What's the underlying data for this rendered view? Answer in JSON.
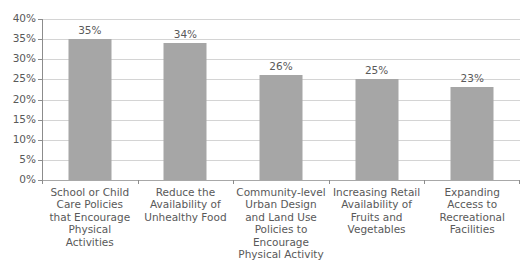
{
  "chart_data": {
    "type": "bar",
    "title": "",
    "subtitle": "",
    "xlabel": "",
    "ylabel": "",
    "ylim": [
      0,
      40
    ],
    "ytick_step": 5,
    "grid": true,
    "legend": "none",
    "value_label_format": "percent",
    "bar_color": "#a6a6a6",
    "gridline_color": "#d4d4d4",
    "axis_color": "#8c8c8c",
    "text_color": "#595959",
    "categories": [
      "School or Child Care Policies that Encourage Physical Activities",
      "Reduce the Availability of Unhealthy Food",
      "Community-level Urban Design and Land Use Policies to Encourage Physical Activity",
      "Increasing Retail Availability of Fruits and Vegetables",
      "Expanding Access to Recreational Facilities"
    ],
    "category_lines": [
      [
        "School or Child",
        "Care Policies",
        "that Encourage",
        "Physical",
        "Activities"
      ],
      [
        "Reduce the",
        "Availability of",
        "Unhealthy Food"
      ],
      [
        "Community-level",
        "Urban Design",
        "and Land Use",
        "Policies to",
        "Encourage",
        "Physical Activity"
      ],
      [
        "Increasing Retail",
        "Availability of",
        "Fruits and",
        "Vegetables"
      ],
      [
        "Expanding",
        "Access to",
        "Recreational",
        "Facilities"
      ]
    ],
    "values": [
      35,
      34,
      26,
      25,
      23
    ],
    "value_labels": [
      "35%",
      "34%",
      "26%",
      "25%",
      "23%"
    ],
    "ytick_labels": [
      "40%",
      "35%",
      "30%",
      "25%",
      "20%",
      "15%",
      "10%",
      "5%",
      "0%"
    ],
    "ytick_values": [
      40,
      35,
      30,
      25,
      20,
      15,
      10,
      5,
      0
    ]
  }
}
